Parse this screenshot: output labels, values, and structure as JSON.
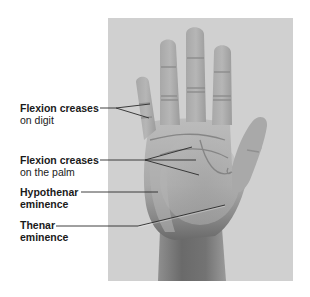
{
  "figure": {
    "colors": {
      "page_background": "#ffffff",
      "photo_background": "#d0d0d0",
      "skin_light": "#bdbdbd",
      "skin_mid": "#a6a6a6",
      "skin_dark": "#6e6e6e",
      "crease": "#8a8a8a",
      "leader_line": "#2a2a2a",
      "text": "#1a1a1a"
    },
    "labels": [
      {
        "id": "flexion-creases-digit",
        "line1": "Flexion creases",
        "line2": "on digit",
        "line2_bold": false
      },
      {
        "id": "flexion-creases-palm",
        "line1": "Flexion creases",
        "line2": "on the palm",
        "line2_bold": false
      },
      {
        "id": "hypothenar-eminence",
        "line1": "Hypothenar",
        "line2": "eminence",
        "line2_bold": true
      },
      {
        "id": "thenar-eminence",
        "line1": "Thenar",
        "line2": "eminence",
        "line2_bold": true
      }
    ]
  }
}
